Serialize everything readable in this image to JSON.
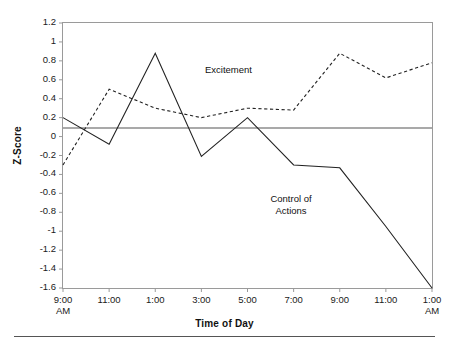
{
  "chart_data": {
    "type": "line",
    "title": "",
    "xlabel": "Time of Day",
    "ylabel": "Z-Score",
    "ylim": [
      -1.6,
      1.2
    ],
    "ytick_labels": [
      "1.2",
      "1",
      "0.8",
      "0.6",
      "0.4",
      "0.2",
      "0",
      "-0.2",
      "-0.4",
      "-0.6",
      "-0.8",
      "-1",
      "-1.2",
      "-1.4",
      "-1.6"
    ],
    "ytick_values": [
      1.2,
      1.0,
      0.8,
      0.6,
      0.4,
      0.2,
      0.0,
      -0.2,
      -0.4,
      -0.6,
      -0.8,
      -1.0,
      -1.2,
      -1.4,
      -1.6
    ],
    "categories": [
      "9:00",
      "11:00",
      "1:00",
      "3:00",
      "5:00",
      "7:00",
      "9:00",
      "11:00",
      "1:00"
    ],
    "xtick_sublabels": [
      "AM",
      "",
      "",
      "",
      "",
      "",
      "",
      "",
      "AM"
    ],
    "grid": false,
    "legend": "annotations",
    "zero_line": true,
    "series": [
      {
        "name": "Excitement",
        "style": "dashed",
        "color": "#222222",
        "label_x_index": 3.2,
        "values": [
          -0.3,
          0.5,
          0.3,
          0.2,
          0.3,
          0.28,
          0.88,
          0.62,
          0.78
        ]
      },
      {
        "name": "Control of Actions",
        "style": "solid",
        "color": "#222222",
        "label_x_index": 5.8,
        "values": [
          0.2,
          -0.08,
          0.88,
          -0.21,
          0.2,
          -0.3,
          -0.33,
          -0.95,
          -1.6
        ]
      }
    ],
    "series_midpoints": {
      "excitement_peak_x_index": 1.0,
      "control_peak_x_index": 2.0
    }
  },
  "annotations": {
    "excitement": "Excitement",
    "control_line1": "Control of",
    "control_line2": "Actions"
  },
  "axes": {
    "x_title": "Time of Day",
    "y_title": "Z-Score"
  }
}
